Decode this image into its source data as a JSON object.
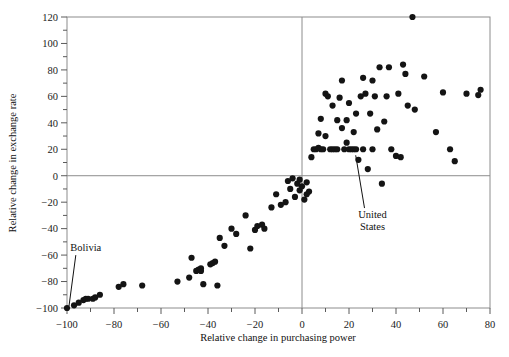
{
  "figure": {
    "background": "#ffffff",
    "point_color": "#141414",
    "axis_color": "#8c8c8c"
  },
  "chart_data": {
    "type": "scatter",
    "title": "",
    "xlabel": "Relative change in purchasing power",
    "ylabel": "Relative change in exchange rate",
    "xlim": [
      -100,
      80
    ],
    "ylim": [
      -100,
      120
    ],
    "xticks": [
      -100,
      -80,
      -60,
      -40,
      -20,
      0,
      20,
      40,
      60,
      80
    ],
    "yticks": [
      -100,
      -80,
      -60,
      -40,
      -20,
      0,
      20,
      40,
      60,
      80,
      100,
      120
    ],
    "xtick_labels": [
      "−100",
      "−80",
      "−60",
      "−40",
      "−20",
      "0",
      "20",
      "40",
      "60",
      "80"
    ],
    "ytick_labels": [
      "−100",
      "−80",
      "−60",
      "−40",
      "−20",
      "0",
      "20",
      "40",
      "60",
      "80",
      "100",
      "120"
    ],
    "minor_tick_interval": 10,
    "grid": false,
    "legend": null,
    "zero_lines": {
      "x": 0,
      "y": 0
    },
    "annotations": [
      {
        "label": "Bolivia",
        "text_x": -92,
        "text_y": -57,
        "point_x": -100,
        "point_y": -100
      },
      {
        "label": "United States",
        "text_x": 30,
        "text_y": -32,
        "point_x": 22,
        "point_y": 20
      }
    ],
    "points": [
      [
        -100,
        -100
      ],
      [
        -97,
        -98
      ],
      [
        -95,
        -96
      ],
      [
        -93,
        -94
      ],
      [
        -92,
        -93
      ],
      [
        -91,
        -93
      ],
      [
        -89,
        -93
      ],
      [
        -88,
        -92
      ],
      [
        -86,
        -90
      ],
      [
        -78,
        -84
      ],
      [
        -76,
        -82
      ],
      [
        -68,
        -83
      ],
      [
        -53,
        -80
      ],
      [
        -48,
        -77
      ],
      [
        -47,
        -62
      ],
      [
        -45,
        -72
      ],
      [
        -44,
        -71
      ],
      [
        -43,
        -70
      ],
      [
        -43,
        -72
      ],
      [
        -42,
        -82
      ],
      [
        -39,
        -67
      ],
      [
        -38,
        -66
      ],
      [
        -37,
        -65
      ],
      [
        -36,
        -83
      ],
      [
        -35,
        -47
      ],
      [
        -33,
        -53
      ],
      [
        -30,
        -40
      ],
      [
        -28,
        -44
      ],
      [
        -24,
        -30
      ],
      [
        -22,
        -55
      ],
      [
        -20,
        -41
      ],
      [
        -19,
        -38
      ],
      [
        -17,
        -37
      ],
      [
        -16,
        -40
      ],
      [
        -13,
        -24
      ],
      [
        -11,
        -14
      ],
      [
        -9,
        -22
      ],
      [
        -7,
        -20
      ],
      [
        -6,
        -4
      ],
      [
        -5,
        -10
      ],
      [
        -4,
        -2
      ],
      [
        -3,
        -16
      ],
      [
        -2,
        -6
      ],
      [
        -1,
        -3
      ],
      [
        -1,
        -11
      ],
      [
        0,
        -8
      ],
      [
        1,
        -18
      ],
      [
        2,
        -5
      ],
      [
        2,
        -14
      ],
      [
        3,
        -12
      ],
      [
        4,
        14
      ],
      [
        5,
        20
      ],
      [
        6,
        20
      ],
      [
        7,
        21
      ],
      [
        7,
        32
      ],
      [
        8,
        20
      ],
      [
        8,
        43
      ],
      [
        9,
        20
      ],
      [
        10,
        30
      ],
      [
        10,
        62
      ],
      [
        11,
        60
      ],
      [
        12,
        20
      ],
      [
        13,
        20
      ],
      [
        13,
        53
      ],
      [
        14,
        20
      ],
      [
        15,
        20
      ],
      [
        15,
        42
      ],
      [
        16,
        59
      ],
      [
        17,
        72
      ],
      [
        17,
        36
      ],
      [
        18,
        20
      ],
      [
        19,
        42
      ],
      [
        19,
        25
      ],
      [
        20,
        20
      ],
      [
        20,
        55
      ],
      [
        21,
        20
      ],
      [
        22,
        20
      ],
      [
        22,
        33
      ],
      [
        23,
        20
      ],
      [
        23,
        47
      ],
      [
        24,
        12
      ],
      [
        25,
        60
      ],
      [
        26,
        20
      ],
      [
        26,
        74
      ],
      [
        27,
        62
      ],
      [
        28,
        5
      ],
      [
        29,
        47
      ],
      [
        30,
        20
      ],
      [
        30,
        72
      ],
      [
        31,
        60
      ],
      [
        32,
        35
      ],
      [
        33,
        82
      ],
      [
        34,
        -6
      ],
      [
        35,
        41
      ],
      [
        36,
        60
      ],
      [
        37,
        82
      ],
      [
        38,
        20
      ],
      [
        40,
        15
      ],
      [
        41,
        62
      ],
      [
        42,
        14
      ],
      [
        43,
        84
      ],
      [
        44,
        77
      ],
      [
        45,
        53
      ],
      [
        47,
        120
      ],
      [
        48,
        50
      ],
      [
        52,
        75
      ],
      [
        57,
        33
      ],
      [
        60,
        63
      ],
      [
        63,
        20
      ],
      [
        65,
        11
      ],
      [
        70,
        62
      ],
      [
        75,
        61
      ],
      [
        76,
        65
      ]
    ]
  }
}
